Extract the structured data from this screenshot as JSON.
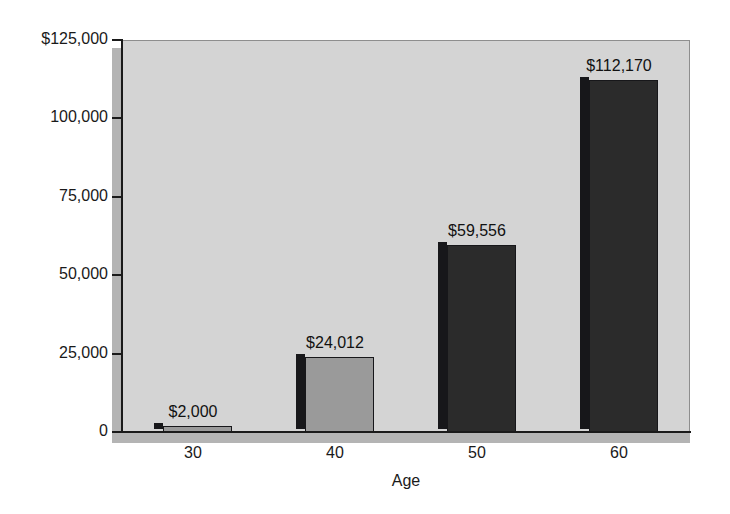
{
  "chart_data": {
    "type": "bar",
    "title": "",
    "xlabel": "Age",
    "ylabel": "",
    "categories": [
      "30",
      "40",
      "50",
      "60"
    ],
    "values": [
      2000,
      24012,
      59556,
      112170
    ],
    "data_labels": [
      "$2,000",
      "$24,012",
      "$59,556",
      "$112,170"
    ],
    "bar_colors": [
      "#9a9a9a",
      "#9a9a9a",
      "#2b2b2b",
      "#2b2b2b"
    ],
    "bar_side_color": "#17171a",
    "ylim": [
      0,
      125000
    ],
    "yticks": [
      0,
      25000,
      50000,
      75000,
      100000,
      125000
    ],
    "ytick_labels": [
      "0",
      "25,000",
      "50,000",
      "75,000",
      "100,000",
      "$125,000"
    ],
    "xtick_labels": [
      "30",
      "40",
      "50",
      "60"
    ],
    "grid": false,
    "legend": null,
    "plot_background": "#d4d4d4",
    "figure_background": "#ffffff",
    "axis_color": "#1a1a1a"
  }
}
